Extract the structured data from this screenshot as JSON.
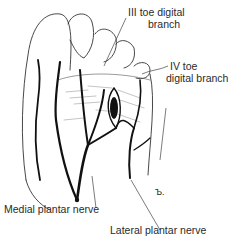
{
  "figure": {
    "labels": {
      "third_toe": [
        "III toe digital",
        "branch"
      ],
      "fourth_toe": [
        "IV toe",
        "digital branch"
      ],
      "medial": "Medial plantar nerve",
      "lateral": "Lateral plantar nerve"
    },
    "signature": "Ъ."
  }
}
